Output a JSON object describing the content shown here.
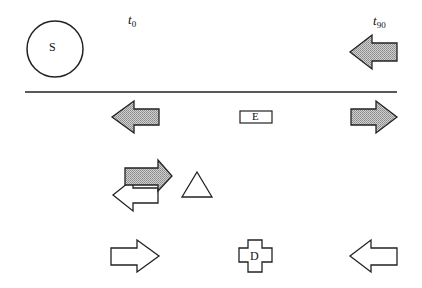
{
  "diagram": {
    "source_label": "S",
    "time_labels": {
      "start": {
        "symbol": "t",
        "subscript": "0"
      },
      "end": {
        "symbol": "t",
        "subscript": "90"
      }
    },
    "entity_box_label": "E",
    "destination_label": "D",
    "colors": {
      "stroke": "#222222",
      "shaded_fill": "#b8b8b8",
      "open_fill": "#ffffff"
    },
    "arrows": [
      {
        "id": "top-right",
        "direction": "left",
        "fill": "shaded"
      },
      {
        "id": "row2-left",
        "direction": "left",
        "fill": "shaded"
      },
      {
        "id": "row2-right",
        "direction": "right",
        "fill": "shaded"
      },
      {
        "id": "row3-shaded",
        "direction": "right",
        "fill": "shaded"
      },
      {
        "id": "row3-open",
        "direction": "left",
        "fill": "open"
      },
      {
        "id": "row4-left",
        "direction": "right",
        "fill": "open"
      },
      {
        "id": "row4-right",
        "direction": "left",
        "fill": "open"
      }
    ],
    "shapes": [
      "circle",
      "rectangle",
      "triangle",
      "cross"
    ]
  }
}
